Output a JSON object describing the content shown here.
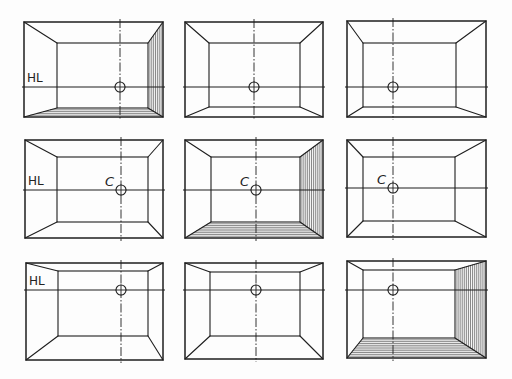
{
  "diagram": {
    "title": "One-point perspective room studies (3x3 grid)",
    "colors": {
      "ink": "#1e1e1e",
      "hatch": "#3a3a3a",
      "paper": "#fdfdfd"
    },
    "labels": {
      "horizon": "HL",
      "center": "C"
    },
    "frames": [
      {
        "id": "r1c1",
        "outer": [
          24,
          22,
          163,
          117
        ],
        "inner": [
          57,
          43,
          148,
          108
        ],
        "hl": 87,
        "cx": 120,
        "cr": 5,
        "showHL": true,
        "showC": false,
        "hatchFloor": true,
        "hatchRight": true
      },
      {
        "id": "r1c2",
        "outer": [
          185,
          22,
          323,
          117
        ],
        "inner": [
          209,
          43,
          300,
          107
        ],
        "hl": 87,
        "cx": 254,
        "cr": 5,
        "showHL": false,
        "showC": false,
        "hatchFloor": false,
        "hatchRight": false
      },
      {
        "id": "r1c3",
        "outer": [
          347,
          21,
          486,
          117
        ],
        "inner": [
          363,
          43,
          456,
          107
        ],
        "hl": 87,
        "cx": 393,
        "cr": 5,
        "showHL": false,
        "showC": false,
        "hatchFloor": false,
        "hatchRight": false
      },
      {
        "id": "r2c1",
        "outer": [
          25,
          140,
          163,
          238
        ],
        "inner": [
          57,
          157,
          148,
          222
        ],
        "hl": 190,
        "cx": 121,
        "cr": 5,
        "showHL": true,
        "showC": true,
        "hatchFloor": false,
        "hatchRight": false
      },
      {
        "id": "r2c2",
        "outer": [
          185,
          140,
          323,
          238
        ],
        "inner": [
          211,
          157,
          300,
          222
        ],
        "hl": 190,
        "cx": 256,
        "cr": 5,
        "showHL": false,
        "showC": true,
        "hatchFloor": true,
        "hatchRight": true
      },
      {
        "id": "r2c3",
        "outer": [
          347,
          140,
          486,
          237
        ],
        "inner": [
          363,
          157,
          455,
          221
        ],
        "hl": 188,
        "cx": 393,
        "cr": 5,
        "showHL": false,
        "showC": true,
        "hatchFloor": false,
        "hatchRight": false
      },
      {
        "id": "r3c1",
        "outer": [
          26,
          263,
          163,
          360
        ],
        "inner": [
          58,
          271,
          148,
          336
        ],
        "hl": 290,
        "cx": 121,
        "cr": 5,
        "showHL": true,
        "showC": false,
        "hatchFloor": false,
        "hatchRight": false
      },
      {
        "id": "r3c2",
        "outer": [
          185,
          263,
          323,
          359
        ],
        "inner": [
          210,
          272,
          300,
          336
        ],
        "hl": 290,
        "cx": 256,
        "cr": 5,
        "showHL": false,
        "showC": false,
        "hatchFloor": false,
        "hatchRight": false
      },
      {
        "id": "r3c3",
        "outer": [
          347,
          261,
          486,
          358
        ],
        "inner": [
          363,
          270,
          455,
          338
        ],
        "hl": 290,
        "cx": 393,
        "cr": 5,
        "showHL": false,
        "showC": false,
        "hatchFloor": true,
        "hatchRight": true
      }
    ]
  }
}
